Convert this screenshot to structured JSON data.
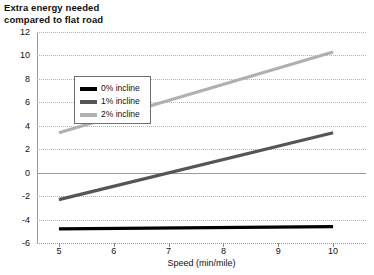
{
  "chart_data": {
    "type": "line",
    "title": "Extra energy needed\ncompared to flat road",
    "xlabel": "Speed (min/mile)",
    "ylabel": "",
    "xlim": [
      4.6,
      10.6
    ],
    "ylim": [
      -6,
      12
    ],
    "xticks": [
      5,
      6,
      7,
      8,
      9,
      10
    ],
    "yticks": [
      -6,
      -4,
      -2,
      0,
      2,
      4,
      6,
      8,
      10,
      12
    ],
    "grid": true,
    "legend_position": "top-left",
    "x": [
      5,
      10
    ],
    "series": [
      {
        "name": "0% incline",
        "color": "#000000",
        "values": [
          -4.8,
          -4.6
        ]
      },
      {
        "name": "1% incline",
        "color": "#555555",
        "values": [
          -2.3,
          3.4
        ]
      },
      {
        "name": "2% incline",
        "color": "#b0b0b0",
        "values": [
          3.4,
          10.3
        ]
      }
    ]
  },
  "title_text": "Extra energy needed\ncompared to flat road",
  "axis": {
    "x_title": "Speed (min/mile)",
    "x_tick_labels": [
      "5",
      "6",
      "7",
      "8",
      "9",
      "10"
    ],
    "y_tick_labels": [
      "12",
      "10",
      "8",
      "6",
      "4",
      "2",
      "0",
      "-2",
      "-4",
      "-6"
    ]
  },
  "legend": {
    "entries": [
      {
        "label": "0% incline",
        "color": "#000000"
      },
      {
        "label": "1% incline",
        "color": "#555555"
      },
      {
        "label": "2% incline",
        "color": "#b0b0b0"
      }
    ]
  }
}
